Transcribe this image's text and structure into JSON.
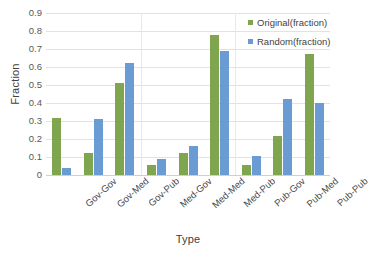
{
  "chart_data": {
    "type": "bar",
    "title": "",
    "xlabel": "Type",
    "ylabel": "Fraction",
    "categories": [
      "Gov-Gov",
      "Gov-Med",
      "Gov-Pub",
      "Med-Gov",
      "Med-Med",
      "Med-Pub",
      "Pub-Gov",
      "Pub-Med",
      "Pub-Pub"
    ],
    "series": [
      {
        "name": "Original(fraction)",
        "color": "#7fa64e",
        "values": [
          0.315,
          0.125,
          0.51,
          0.055,
          0.12,
          0.78,
          0.055,
          0.215,
          0.67
        ]
      },
      {
        "name": "Random(fraction)",
        "color": "#6a9bd2",
        "values": [
          0.04,
          0.31,
          0.62,
          0.09,
          0.16,
          0.69,
          0.105,
          0.42,
          0.4
        ]
      }
    ],
    "ylim": [
      0,
      0.9
    ],
    "ytick_labels": [
      "0.9",
      "0.8",
      "0.7",
      "0.6",
      "0.5",
      "0.4",
      "0.3",
      "0.2",
      "0.1",
      "0"
    ],
    "ytick_values": [
      0.9,
      0.8,
      0.7,
      0.6,
      0.5,
      0.4,
      0.3,
      0.2,
      0.1,
      0
    ],
    "grid": true,
    "legend_position": "top-right",
    "group_separators_after": [
      2,
      5
    ]
  }
}
